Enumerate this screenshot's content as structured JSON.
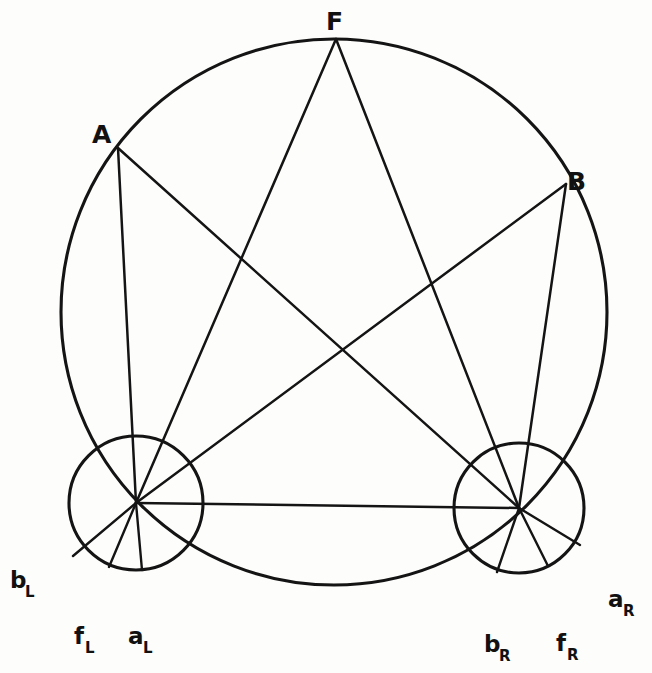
{
  "figure": {
    "background_color": "#fdfdfb",
    "stroke_color": "#141414",
    "width": 652,
    "height": 673
  },
  "chart_data": {
    "type": "diagram",
    "xlabel": "",
    "ylabel": "",
    "grid": false,
    "legend": null,
    "circles": [
      {
        "name": "large-circle",
        "role": "horopter",
        "cx": 334,
        "cy": 312,
        "r": 273
      },
      {
        "name": "left-eye-circle",
        "role": "left-eye",
        "cx": 136,
        "cy": 503,
        "r": 67
      },
      {
        "name": "right-eye-circle",
        "role": "right-eye",
        "cx": 519,
        "cy": 508,
        "r": 65
      }
    ],
    "points": [
      {
        "id": "F",
        "label": "F",
        "x": 336,
        "y": 39,
        "label_x": 331,
        "label_y": 22
      },
      {
        "id": "A",
        "label": "A",
        "x": 118,
        "y": 148,
        "label_x": 101,
        "label_y": 134
      },
      {
        "id": "B",
        "label": "B",
        "x": 566,
        "y": 184,
        "label_x": 578,
        "label_y": 180
      },
      {
        "id": "OL",
        "label": "",
        "x": 136,
        "y": 503,
        "label_x": 136,
        "label_y": 503
      },
      {
        "id": "OR",
        "label": "",
        "x": 519,
        "y": 508,
        "label_x": 519,
        "label_y": 508
      },
      {
        "id": "bL",
        "label": "b",
        "sub": "L",
        "x": 73,
        "y": 556,
        "label_x": 14,
        "label_y": 581
      },
      {
        "id": "fL",
        "label": "f",
        "sub": "L",
        "x": 109,
        "y": 567,
        "label_x": 76,
        "label_y": 636
      },
      {
        "id": "aL",
        "label": "a",
        "sub": "L",
        "x": 142,
        "y": 570,
        "label_x": 131,
        "label_y": 636
      },
      {
        "id": "bR",
        "label": "b",
        "sub": "R",
        "x": 497,
        "y": 572,
        "label_x": 487,
        "label_y": 645
      },
      {
        "id": "fR",
        "label": "f",
        "sub": "R",
        "x": 548,
        "y": 566,
        "label_x": 559,
        "label_y": 644
      },
      {
        "id": "aR",
        "label": "a",
        "sub": "R",
        "x": 580,
        "y": 545,
        "label_x": 610,
        "label_y": 601
      }
    ],
    "chords": [
      {
        "name": "chord-F-to-left-center",
        "from": "F",
        "to": "OL"
      },
      {
        "name": "chord-F-to-right-center",
        "from": "F",
        "to": "OR"
      },
      {
        "name": "chord-A-to-left-center",
        "from": "A",
        "to": "OL"
      },
      {
        "name": "chord-A-to-right-center",
        "from": "A",
        "to": "OR"
      },
      {
        "name": "chord-B-to-left-center",
        "from": "B",
        "to": "OL"
      },
      {
        "name": "chord-B-to-right-center",
        "from": "B",
        "to": "OR"
      },
      {
        "name": "interocular-axis",
        "from": "OL",
        "to": "OR"
      }
    ],
    "spokes": [
      {
        "name": "spoke-left-to-bL",
        "from": "OL",
        "to": "bL"
      },
      {
        "name": "spoke-left-to-fL",
        "from": "OL",
        "to": "fL"
      },
      {
        "name": "spoke-left-to-aL",
        "from": "OL",
        "to": "aL"
      },
      {
        "name": "spoke-right-to-bR",
        "from": "OR",
        "to": "bR"
      },
      {
        "name": "spoke-right-to-fR",
        "from": "OR",
        "to": "fR"
      },
      {
        "name": "spoke-right-to-aR",
        "from": "OR",
        "to": "aR"
      }
    ],
    "labels": [
      {
        "id": "F",
        "text": "F"
      },
      {
        "id": "A",
        "text": "A"
      },
      {
        "id": "B",
        "text": "B"
      },
      {
        "id": "bL",
        "text": "b",
        "sub": "L"
      },
      {
        "id": "fL",
        "text": "f",
        "sub": "L"
      },
      {
        "id": "aL",
        "text": "a",
        "sub": "L"
      },
      {
        "id": "bR",
        "text": "b",
        "sub": "R"
      },
      {
        "id": "fR",
        "text": "f",
        "sub": "R"
      },
      {
        "id": "aR",
        "text": "a",
        "sub": "R"
      }
    ]
  }
}
